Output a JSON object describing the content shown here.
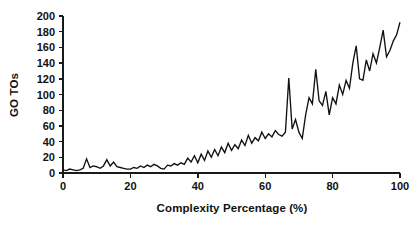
{
  "chart_data": {
    "type": "line",
    "title": "",
    "xlabel": "Complexity Percentage (%)",
    "ylabel": "GO TOs",
    "xlim": [
      0,
      100
    ],
    "ylim": [
      0,
      200
    ],
    "grid": false,
    "legend": null,
    "line_color": "#111111",
    "background_color": "#ffffff",
    "xticks": [
      0,
      20,
      40,
      60,
      80,
      100
    ],
    "xtick_labels": [
      "0",
      "20",
      "40",
      "60",
      "80",
      "100"
    ],
    "yticks": [
      0,
      20,
      40,
      60,
      80,
      100,
      120,
      140,
      160,
      180,
      200
    ],
    "ytick_labels": [
      "0",
      "20",
      "40",
      "60",
      "80",
      "100",
      "120",
      "140",
      "160",
      "180",
      "200"
    ],
    "annotations": [
      "Sharp isolated spike to about 121 GO TOs near 67% complexity",
      "Overall monotonically increasing noisy trend from near 3 to about 192"
    ],
    "series": [
      {
        "name": "GO TOs",
        "x": [
          0,
          1,
          2,
          3,
          4,
          5,
          6,
          7,
          8,
          9,
          10,
          11,
          12,
          13,
          14,
          15,
          16,
          17,
          18,
          19,
          20,
          21,
          22,
          23,
          24,
          25,
          26,
          27,
          28,
          29,
          30,
          31,
          32,
          33,
          34,
          35,
          36,
          37,
          38,
          39,
          40,
          41,
          42,
          43,
          44,
          45,
          46,
          47,
          48,
          49,
          50,
          51,
          52,
          53,
          54,
          55,
          56,
          57,
          58,
          59,
          60,
          61,
          62,
          63,
          64,
          65,
          66,
          67,
          68,
          69,
          70,
          71,
          72,
          73,
          74,
          75,
          76,
          77,
          78,
          79,
          80,
          81,
          82,
          83,
          84,
          85,
          86,
          87,
          88,
          89,
          90,
          91,
          92,
          93,
          94,
          95,
          96,
          97,
          98,
          99,
          100
        ],
        "values": [
          4,
          3,
          5,
          4,
          3,
          4,
          6,
          18,
          7,
          9,
          8,
          6,
          9,
          17,
          9,
          14,
          8,
          7,
          6,
          5,
          5,
          7,
          6,
          9,
          7,
          10,
          8,
          11,
          9,
          6,
          5,
          10,
          9,
          12,
          10,
          13,
          11,
          19,
          14,
          22,
          13,
          24,
          16,
          28,
          20,
          30,
          22,
          33,
          26,
          38,
          29,
          36,
          31,
          42,
          35,
          48,
          38,
          45,
          41,
          52,
          44,
          50,
          46,
          54,
          49,
          47,
          52,
          121,
          56,
          68,
          52,
          44,
          74,
          96,
          88,
          132,
          92,
          86,
          104,
          74,
          96,
          88,
          112,
          100,
          118,
          108,
          140,
          162,
          120,
          118,
          144,
          130,
          152,
          140,
          160,
          182,
          148,
          156,
          168,
          176,
          192
        ]
      }
    ]
  },
  "axis_titles": {
    "x": "Complexity Percentage (%)",
    "y": "GO TOs"
  }
}
